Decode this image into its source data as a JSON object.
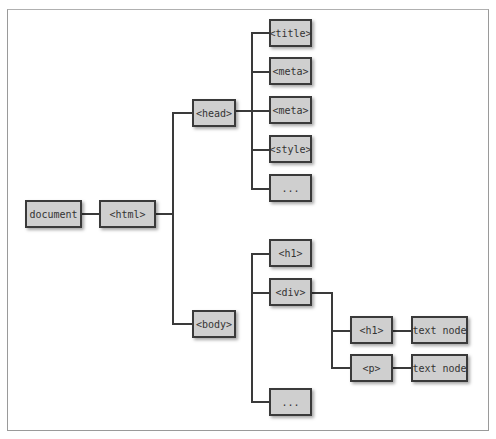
{
  "diagram": {
    "nodes": {
      "document": "document",
      "html": "<html>",
      "head": "<head>",
      "title": "<title>",
      "meta1": "<meta>",
      "meta2": "<meta>",
      "style": "<style>",
      "head_more": "...",
      "body": "<body>",
      "h1": "<h1>",
      "div": "<div>",
      "div_h1": "<h1>",
      "div_p": "<p>",
      "h1_text": "text node",
      "p_text": "text node",
      "body_more": "..."
    },
    "edges": [
      [
        "document",
        "html"
      ],
      [
        "html",
        "head"
      ],
      [
        "html",
        "body"
      ],
      [
        "head",
        "title"
      ],
      [
        "head",
        "meta1"
      ],
      [
        "head",
        "meta2"
      ],
      [
        "head",
        "style"
      ],
      [
        "head",
        "head_more"
      ],
      [
        "body",
        "h1"
      ],
      [
        "body",
        "div"
      ],
      [
        "body",
        "body_more"
      ],
      [
        "div",
        "div_h1"
      ],
      [
        "div",
        "div_p"
      ],
      [
        "div_h1",
        "h1_text"
      ],
      [
        "div_p",
        "p_text"
      ]
    ],
    "colors": {
      "node_fill": "#cfcfcf",
      "node_border": "#3a3a3a",
      "connector": "#3a3a3a",
      "frame": "#9a9a9a"
    }
  }
}
